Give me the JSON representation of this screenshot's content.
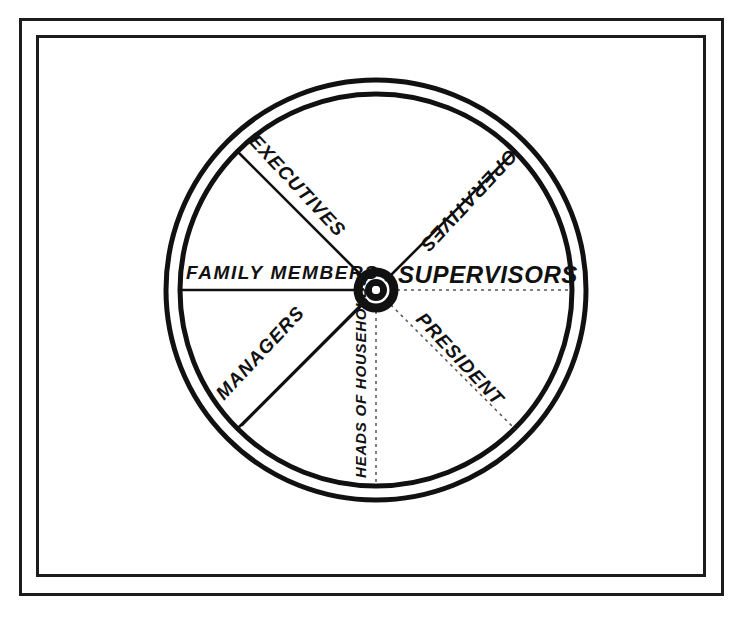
{
  "diagram": {
    "type": "spoke-wheel",
    "hub_label": "",
    "colors": {
      "ink": "#111111",
      "paper": "#ffffff",
      "faint_line": "#555555"
    },
    "frame": {
      "style": "double-rule border"
    },
    "wheel": {
      "center_x": 376,
      "center_y": 290,
      "outer_radius": 210,
      "inner_radius": 196,
      "hub_outer_radius": 22,
      "hub_inner_radius": 10
    },
    "spokes": [
      {
        "id": "executives",
        "label": "EXECUTIVES",
        "angle_deg": 135,
        "line_style": "solid",
        "text_orientation": "along-spoke"
      },
      {
        "id": "operatives",
        "label": "OPERATIVES",
        "angle_deg": 45,
        "line_style": "solid",
        "text_orientation": "along-spoke"
      },
      {
        "id": "family-members",
        "label": "FAMILY MEMBERS",
        "angle_deg": 180,
        "line_style": "solid",
        "text_orientation": "horizontal"
      },
      {
        "id": "supervisors",
        "label": "SUPERVISORS",
        "angle_deg": 0,
        "line_style": "dotted",
        "text_orientation": "horizontal"
      },
      {
        "id": "managers",
        "label": "MANAGERS",
        "angle_deg": 225,
        "line_style": "double",
        "text_orientation": "along-spoke"
      },
      {
        "id": "president",
        "label": "PRESIDENT",
        "angle_deg": 315,
        "line_style": "dotted",
        "text_orientation": "along-spoke"
      },
      {
        "id": "heads-of-households",
        "label": "HEADS OF HOUSEHOLDS",
        "angle_deg": 270,
        "line_style": "dotted",
        "text_orientation": "vertical"
      }
    ]
  }
}
